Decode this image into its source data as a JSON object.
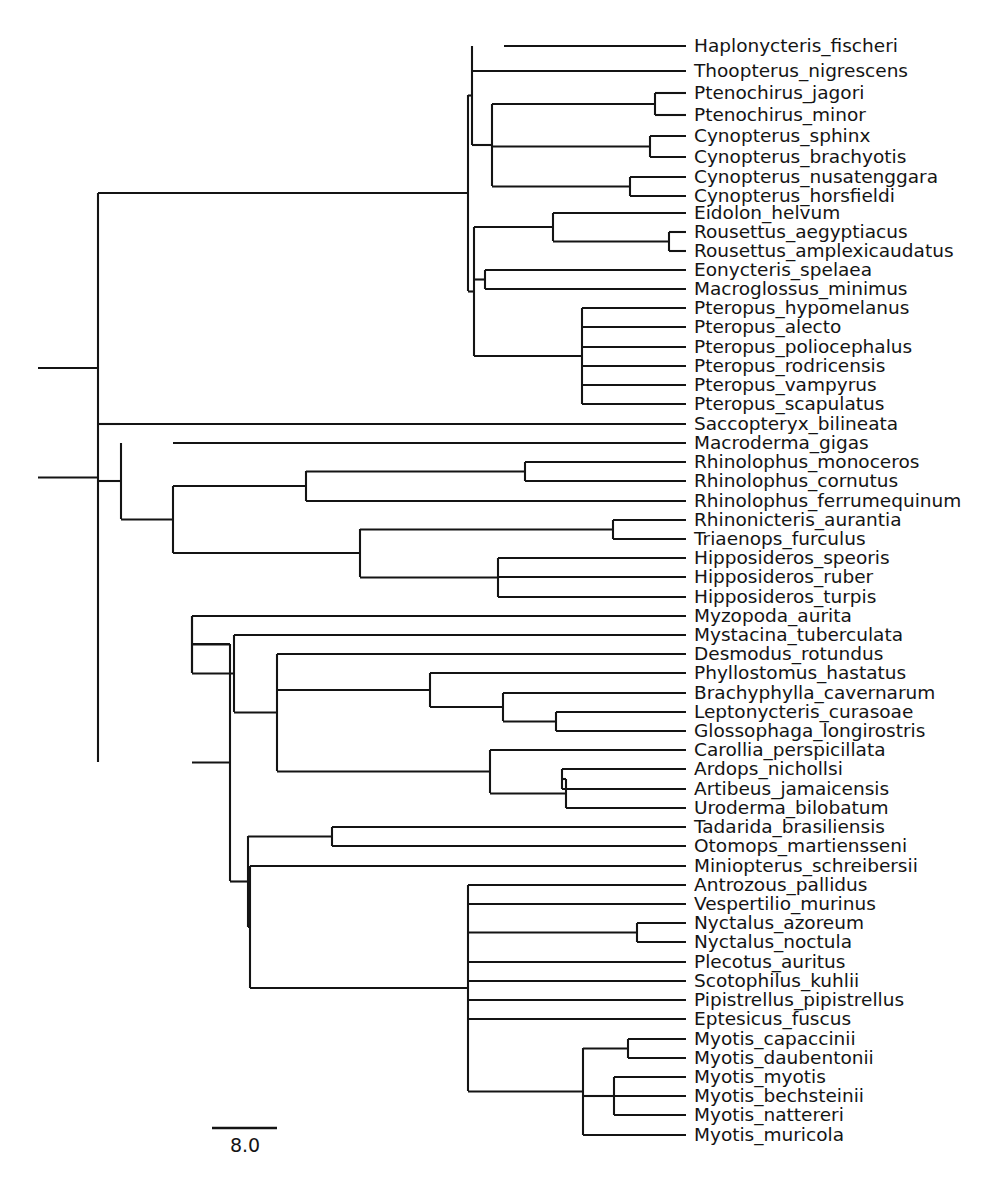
{
  "figure": {
    "type": "phylogenetic-tree",
    "style": "rectangular-cladogram",
    "title": "",
    "background_color": "#ffffff",
    "line_color": "#141414",
    "text_color": "#141414",
    "taxon_count": 54
  },
  "scale_bar": {
    "label": "8.0",
    "x_start": 212,
    "x_end": 277,
    "y": 1128,
    "label_x": 245,
    "label_y": 1152,
    "units": "branch length"
  },
  "taxa": [
    {
      "name": "Haplonycteris_fischeri",
      "y": 46,
      "branch_x": 504
    },
    {
      "name": "Thoopterus_nigrescens",
      "y": 71,
      "branch_x": 472
    },
    {
      "name": "Ptenochirus_jagori",
      "y": 93,
      "branch_x": 655
    },
    {
      "name": "Ptenochirus_minor",
      "y": 115,
      "branch_x": 655
    },
    {
      "name": "Cynopterus_sphinx",
      "y": 136,
      "branch_x": 650
    },
    {
      "name": "Cynopterus_brachyotis",
      "y": 157,
      "branch_x": 650
    },
    {
      "name": "Cynopterus_nusatenggara",
      "y": 177,
      "branch_x": 630
    },
    {
      "name": "Cynopterus_horsfieldi",
      "y": 196,
      "branch_x": 630
    },
    {
      "name": "Eidolon_helvum",
      "y": 213,
      "branch_x": 553
    },
    {
      "name": "Rousettus_aegyptiacus",
      "y": 232,
      "branch_x": 669
    },
    {
      "name": "Rousettus_amplexicaudatus",
      "y": 251,
      "branch_x": 669
    },
    {
      "name": "Eonycteris_spelaea",
      "y": 270,
      "branch_x": 485
    },
    {
      "name": "Macroglossus_minimus",
      "y": 289,
      "branch_x": 485
    },
    {
      "name": "Pteropus_hypomelanus",
      "y": 308,
      "branch_x": 582
    },
    {
      "name": "Pteropus_alecto",
      "y": 327,
      "branch_x": 582
    },
    {
      "name": "Pteropus_poliocephalus",
      "y": 347,
      "branch_x": 582
    },
    {
      "name": "Pteropus_rodricensis",
      "y": 366,
      "branch_x": 582
    },
    {
      "name": "Pteropus_vampyrus",
      "y": 385,
      "branch_x": 582
    },
    {
      "name": "Pteropus_scapulatus",
      "y": 404,
      "branch_x": 582
    },
    {
      "name": "Saccopteryx_bilineata",
      "y": 424,
      "branch_x": 120
    },
    {
      "name": "Macroderma_gigas",
      "y": 443,
      "branch_x": 173
    },
    {
      "name": "Rhinolophus_monoceros",
      "y": 462,
      "branch_x": 525
    },
    {
      "name": "Rhinolophus_cornutus",
      "y": 481,
      "branch_x": 525
    },
    {
      "name": "Rhinolophus_ferrumequinum",
      "y": 501,
      "branch_x": 306
    },
    {
      "name": "Rhinonicteris_aurantia",
      "y": 520,
      "branch_x": 613
    },
    {
      "name": "Triaenops_furculus",
      "y": 539,
      "branch_x": 613
    },
    {
      "name": "Hipposideros_speoris",
      "y": 558,
      "branch_x": 498
    },
    {
      "name": "Hipposideros_ruber",
      "y": 577,
      "branch_x": 498
    },
    {
      "name": "Hipposideros_turpis",
      "y": 597,
      "branch_x": 498
    },
    {
      "name": "Myzopoda_aurita",
      "y": 616,
      "branch_x": 192
    },
    {
      "name": "Mystacina_tuberculata",
      "y": 635,
      "branch_x": 234
    },
    {
      "name": "Desmodus_rotundus",
      "y": 654,
      "branch_x": 277
    },
    {
      "name": "Phyllostomus_hastatus",
      "y": 673,
      "branch_x": 430
    },
    {
      "name": "Brachyphylla_cavernarum",
      "y": 693,
      "branch_x": 503
    },
    {
      "name": "Leptonycteris_curasoae",
      "y": 712,
      "branch_x": 556
    },
    {
      "name": "Glossophaga_longirostris",
      "y": 731,
      "branch_x": 556
    },
    {
      "name": "Carollia_perspicillata",
      "y": 750,
      "branch_x": 490
    },
    {
      "name": "Ardops_nichollsi",
      "y": 769,
      "branch_x": 562
    },
    {
      "name": "Artibeus_jamaicensis",
      "y": 789,
      "branch_x": 562
    },
    {
      "name": "Uroderma_bilobatum",
      "y": 808,
      "branch_x": 566
    },
    {
      "name": "Tadarida_brasiliensis",
      "y": 827,
      "branch_x": 332
    },
    {
      "name": "Otomops_martiensseni",
      "y": 846,
      "branch_x": 332
    },
    {
      "name": "Miniopterus_schreibersii",
      "y": 866,
      "branch_x": 250
    },
    {
      "name": "Antrozous_pallidus",
      "y": 885,
      "branch_x": 468
    },
    {
      "name": "Vespertilio_murinus",
      "y": 904,
      "branch_x": 468
    },
    {
      "name": "Nyctalus_azoreum",
      "y": 923,
      "branch_x": 637
    },
    {
      "name": "Nyctalus_noctula",
      "y": 942,
      "branch_x": 637
    },
    {
      "name": "Plecotus_auritus",
      "y": 962,
      "branch_x": 468
    },
    {
      "name": "Scotophilus_kuhlii",
      "y": 981,
      "branch_x": 468
    },
    {
      "name": "Pipistrellus_pipistrellus",
      "y": 1000,
      "branch_x": 468
    },
    {
      "name": "Eptesicus_fuscus",
      "y": 1019,
      "branch_x": 468
    },
    {
      "name": "Myotis_capaccinii",
      "y": 1039,
      "branch_x": 628
    },
    {
      "name": "Myotis_daubentonii",
      "y": 1058,
      "branch_x": 628
    },
    {
      "name": "Myotis_myotis",
      "y": 1077,
      "branch_x": 614
    },
    {
      "name": "Myotis_bechsteinii",
      "y": 1096,
      "branch_x": 614
    },
    {
      "name": "Myotis_nattereri",
      "y": 1115,
      "branch_x": 614
    },
    {
      "name": "Myotis_muricola",
      "y": 1135,
      "branch_x": 583
    }
  ],
  "label_offset_x": 8,
  "clades": [
    {
      "id": "ptenochirus",
      "x": 655,
      "y_top": 93,
      "y_bottom": 115,
      "parent_x": 492
    },
    {
      "id": "cynopterus-sb",
      "x": 650,
      "y_top": 136,
      "y_bottom": 157,
      "parent_x": 492
    },
    {
      "id": "cynopterus-nh",
      "x": 630,
      "y_top": 177,
      "y_bottom": 196,
      "parent_x": 492
    },
    {
      "id": "cynopterinae",
      "x": 492,
      "y_top": 104,
      "y_bottom": 186,
      "parent_x": 472
    },
    {
      "id": "haplo-thoo-cyno",
      "x": 472,
      "y_top": 46,
      "y_bottom": 145,
      "parent_x": 468
    },
    {
      "id": "rousettus",
      "x": 669,
      "y_top": 232,
      "y_bottom": 251,
      "parent_x": 553
    },
    {
      "id": "eidolon-rousettus",
      "x": 553,
      "y_top": 213,
      "y_bottom": 241,
      "parent_x": 474
    },
    {
      "id": "eony-macro",
      "x": 485,
      "y_top": 270,
      "y_bottom": 289,
      "parent_x": 474
    },
    {
      "id": "pteropus",
      "x": 582,
      "y_top": 308,
      "y_bottom": 404,
      "parent_x": 474
    },
    {
      "id": "pteropodinae",
      "x": 474,
      "y_top": 227,
      "y_bottom": 356,
      "parent_x": 468
    },
    {
      "id": "pteropodidae",
      "x": 468,
      "y_top": 95,
      "y_bottom": 291,
      "parent_x": 98
    },
    {
      "id": "rhinolophus3",
      "x": 525,
      "y_top": 462,
      "y_bottom": 481,
      "parent_x": 306
    },
    {
      "id": "rhinolophidae",
      "x": 306,
      "y_top": 471,
      "y_bottom": 501,
      "parent_x": 173
    },
    {
      "id": "rhinonicteris",
      "x": 613,
      "y_top": 520,
      "y_bottom": 539,
      "parent_x": 360
    },
    {
      "id": "hipposideros3",
      "x": 498,
      "y_top": 558,
      "y_bottom": 597,
      "parent_x": 360
    },
    {
      "id": "hipposideridae",
      "x": 360,
      "y_top": 529,
      "y_bottom": 577,
      "parent_x": 173
    },
    {
      "id": "rhinolophoidea",
      "x": 173,
      "y_top": 486,
      "y_bottom": 553,
      "parent_x": 121
    },
    {
      "id": "yinpterochiroptera",
      "x": 121,
      "y_top": 443,
      "y_bottom": 519,
      "parent_x": 98
    },
    {
      "id": "glossophagine",
      "x": 556,
      "y_top": 712,
      "y_bottom": 731,
      "parent_x": 503
    },
    {
      "id": "brachy-glosso",
      "x": 503,
      "y_top": 693,
      "y_bottom": 721,
      "parent_x": 430
    },
    {
      "id": "phyllostomine",
      "x": 430,
      "y_top": 673,
      "y_bottom": 707,
      "parent_x": 277
    },
    {
      "id": "ardops-artibeus",
      "x": 562,
      "y_top": 769,
      "y_bottom": 789,
      "parent_x": 566
    },
    {
      "id": "stenodermatine",
      "x": 566,
      "y_top": 779,
      "y_bottom": 808,
      "parent_x": 490
    },
    {
      "id": "carollia-steno",
      "x": 490,
      "y_top": 750,
      "y_bottom": 793,
      "parent_x": 277
    },
    {
      "id": "phyllostomidae",
      "x": 277,
      "y_top": 654,
      "y_bottom": 771,
      "parent_x": 234
    },
    {
      "id": "noctilionoidea",
      "x": 234,
      "y_top": 635,
      "y_bottom": 712,
      "parent_x": 192
    },
    {
      "id": "myzo-noctil",
      "x": 192,
      "y_top": 616,
      "y_bottom": 673,
      "parent_x": 230
    },
    {
      "id": "molossidae",
      "x": 332,
      "y_top": 827,
      "y_bottom": 846,
      "parent_x": 248
    },
    {
      "id": "nyctalus",
      "x": 637,
      "y_top": 923,
      "y_bottom": 942,
      "parent_x": 468
    },
    {
      "id": "myotis-cd",
      "x": 628,
      "y_top": 1039,
      "y_bottom": 1058,
      "parent_x": 583
    },
    {
      "id": "myotis-mbn",
      "x": 614,
      "y_top": 1077,
      "y_bottom": 1115,
      "parent_x": 583
    },
    {
      "id": "myotis",
      "x": 583,
      "y_top": 1048,
      "y_bottom": 1135,
      "parent_x": 468
    },
    {
      "id": "vespertilionidae",
      "x": 468,
      "y_top": 885,
      "y_bottom": 1091,
      "parent_x": 250
    },
    {
      "id": "minio-vesper",
      "x": 250,
      "y_top": 866,
      "y_bottom": 988,
      "parent_x": 248
    },
    {
      "id": "vespertilionoidea",
      "x": 248,
      "y_top": 836,
      "y_bottom": 927,
      "parent_x": 230
    },
    {
      "id": "yangochiroptera",
      "x": 230,
      "y_top": 644,
      "y_bottom": 881,
      "parent_x": 192
    },
    {
      "id": "chiroptera-crown",
      "x": 98,
      "y_top": 193,
      "y_bottom": 762,
      "parent_x": 38
    }
  ],
  "root": {
    "x_start": 38,
    "x_end": 98,
    "y": 368
  },
  "extra_segments": [
    {
      "id": "saccopteryx-stem",
      "x1": 98,
      "y1": 424,
      "x2": 120,
      "y2": 424
    },
    {
      "id": "myzopoda-spine",
      "x1": 192,
      "y1": 616,
      "x2": 192,
      "y2": 673
    },
    {
      "id": "yango-to-myzo",
      "x1": 192,
      "y1": 644,
      "x2": 230,
      "y2": 644
    }
  ]
}
